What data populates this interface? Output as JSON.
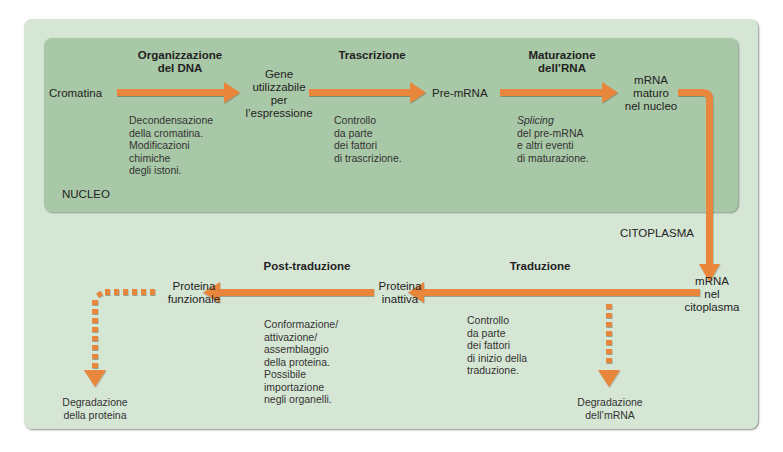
{
  "compartments": {
    "nucleus_label": "NUCLEO",
    "cytoplasm_label": "CITOPLASMA"
  },
  "nodes": {
    "cromatina": "Cromatina",
    "gene": [
      "Gene",
      "utilizzabile",
      "per",
      "l’espressione"
    ],
    "pre_mrna": "Pre-mRNA",
    "mrna_nucleus": [
      "mRNA",
      "maturo",
      "nel nucleo"
    ],
    "mrna_cytoplasm": [
      "mRNA",
      "nel",
      "citoplasma"
    ],
    "inactive_protein": [
      "Proteina",
      "inattiva"
    ],
    "functional_protein": [
      "Proteina",
      "funzionale"
    ],
    "mrna_degradation": [
      "Degradazione",
      "dell’mRNA"
    ],
    "protein_degradation": [
      "Degradazione",
      "della proteina"
    ]
  },
  "steps": {
    "dna_org": {
      "title": [
        "Organizzazione",
        "del DNA"
      ],
      "desc": [
        "Decondensazione",
        "della cromatina.",
        "Modificazioni",
        "chimiche",
        "degli istoni."
      ]
    },
    "transcription": {
      "title": [
        "Trascrizione"
      ],
      "desc": [
        "Controllo",
        "da parte",
        "dei fattori",
        "di trascrizione."
      ]
    },
    "rna_maturation": {
      "title": [
        "Maturazione",
        "dell’RNA"
      ],
      "desc_italic": "Splicing",
      "desc": [
        "del pre-mRNA",
        "e altri eventi",
        "di maturazione."
      ]
    },
    "translation": {
      "title": [
        "Traduzione"
      ],
      "desc": [
        "Controllo",
        "da parte",
        "dei fattori",
        "di inizio della",
        "traduzione."
      ]
    },
    "post_translation": {
      "title": [
        "Post-traduzione"
      ],
      "desc": [
        "Conformazione/",
        "attivazione/",
        "assemblaggio",
        "della proteina.",
        "Possibile",
        "importazione",
        "negli organelli."
      ]
    }
  },
  "colors": {
    "outer_bg": "#d6e6d5",
    "nucleus_bg": "#a9c8a7",
    "arrow": "#e8863a"
  }
}
